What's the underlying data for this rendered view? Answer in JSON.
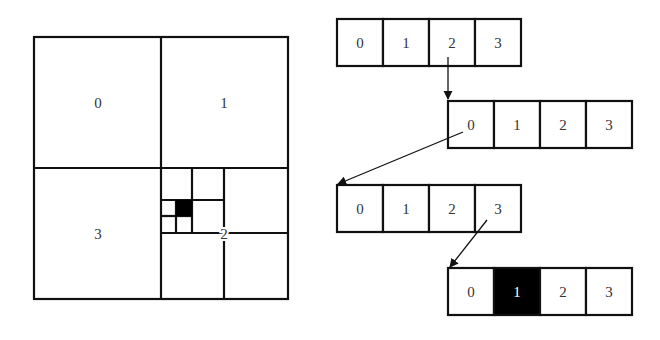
{
  "quadtree": {
    "quadrant_labels": [
      "0",
      "1",
      "2",
      "3"
    ],
    "filled_cell": "black"
  },
  "arrays": [
    {
      "cells": [
        "0",
        "1",
        "2",
        "3"
      ],
      "highlighted": null
    },
    {
      "cells": [
        "0",
        "1",
        "2",
        "3"
      ],
      "highlighted": null
    },
    {
      "cells": [
        "0",
        "1",
        "2",
        "3"
      ],
      "highlighted": null
    },
    {
      "cells": [
        "0",
        "1",
        "2",
        "3"
      ],
      "highlighted": 1
    }
  ],
  "links": [
    {
      "from_array": 0,
      "from_cell": "2",
      "to_array": 1
    },
    {
      "from_array": 1,
      "from_cell": "0",
      "to_array": 2
    },
    {
      "from_array": 2,
      "from_cell": "3",
      "to_array": 3
    }
  ],
  "colors": {
    "stroke": "#111111",
    "fill": "#000000",
    "background": "#ffffff"
  }
}
